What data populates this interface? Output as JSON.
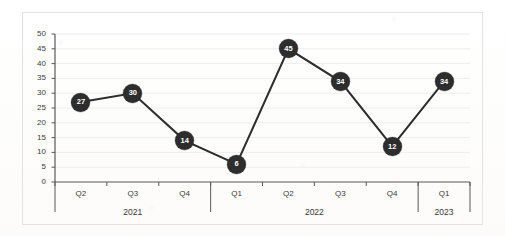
{
  "chart_data": {
    "type": "line",
    "title": "",
    "xlabel": "",
    "ylabel": "",
    "categories": [
      "Q2",
      "Q3",
      "Q4",
      "Q1",
      "Q2",
      "Q3",
      "Q4",
      "Q1"
    ],
    "values": [
      27,
      30,
      14,
      6,
      45,
      34,
      12,
      34
    ],
    "data_labels": [
      "27",
      "30",
      "14",
      "6",
      "45",
      "34",
      "12",
      "34"
    ],
    "groups": [
      {
        "label": "2021",
        "categories": [
          "Q2",
          "Q3",
          "Q4"
        ],
        "count": 3
      },
      {
        "label": "2022",
        "categories": [
          "Q1",
          "Q2",
          "Q3",
          "Q4"
        ],
        "count": 4
      },
      {
        "label": "2023",
        "categories": [
          "Q1"
        ],
        "count": 1
      }
    ],
    "ylim": [
      0,
      50
    ],
    "ytick_step": 5,
    "yticks": [
      "0",
      "5",
      "10",
      "15",
      "20",
      "25",
      "30",
      "35",
      "40",
      "45",
      "50"
    ],
    "grid": "horizontal",
    "legend": "none",
    "marker_color": "#2d2d2d",
    "marker_label_color": "#ffffff",
    "line_color": "#2d2d2d",
    "gridline_color": "#ededed",
    "axis_color": "#595959",
    "border_color": "#e3e3e3",
    "background_color": "#ffffff"
  }
}
